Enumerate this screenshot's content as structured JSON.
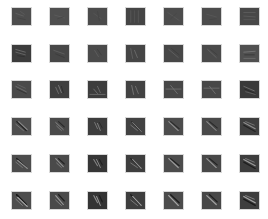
{
  "figure": {
    "rows": 6,
    "cols": 7,
    "background": "#ffffff",
    "tile_border": "#d8d8d8",
    "layout": {
      "x0": 11,
      "y0": 7,
      "dx": 38,
      "dy": 36.7,
      "w": 21,
      "h": 19
    },
    "tiles": [
      [
        {
          "bg": "#4d4d4d",
          "strokes": [
            [
              "M4 6 L12 9",
              "#5f5f5f",
              1
            ],
            [
              "M6 11 L14 13",
              "#444",
              1
            ],
            [
              "M9 4 L13 7",
              "#5a5a5a",
              1
            ]
          ]
        },
        {
          "bg": "#4f4f4f",
          "strokes": [
            [
              "M5 8 L15 11",
              "#5b5b5b",
              1
            ],
            [
              "M8 12 L14 10",
              "#474747",
              1
            ]
          ]
        },
        {
          "bg": "#4b4b4b",
          "strokes": [
            [
              "M6 6 L14 12",
              "#565656",
              1
            ],
            [
              "M10 4 L12 14",
              "#444",
              1
            ]
          ]
        },
        {
          "bg": "#454545",
          "strokes": [
            [
              "M5 3 L5 16",
              "#575757",
              1
            ],
            [
              "M9 3 L9 16",
              "#525252",
              1
            ],
            [
              "M13 3 L13 16",
              "#575757",
              1
            ]
          ]
        },
        {
          "bg": "#4c4c4c",
          "strokes": [
            [
              "M4 5 L16 14",
              "#585858",
              1
            ],
            [
              "M7 12 L13 6",
              "#464646",
              1
            ]
          ]
        },
        {
          "bg": "#4c4c4c",
          "strokes": [
            [
              "M5 7 L15 10",
              "#575757",
              1
            ],
            [
              "M8 13 L15 12",
              "#454545",
              1
            ]
          ]
        },
        {
          "bg": "#484848",
          "strokes": [
            [
              "M4 5 L16 5",
              "#5d5d5d",
              1
            ],
            [
              "M4 9 L16 10",
              "#5a5a5a",
              1
            ],
            [
              "M4 13 L16 13",
              "#565656",
              1
            ]
          ]
        }
      ],
      [
        {
          "bg": "#3c3c3c",
          "strokes": [
            [
              "M4 5 L14 8",
              "#6a6a6a",
              1
            ],
            [
              "M4 8 L14 11",
              "#666",
              1
            ],
            [
              "M6 12 L13 13",
              "#303030",
              1
            ]
          ]
        },
        {
          "bg": "#474747",
          "strokes": [
            [
              "M4 6 L15 10",
              "#5e5e5e",
              1
            ],
            [
              "M6 10 L15 14",
              "#3c3c3c",
              1
            ]
          ]
        },
        {
          "bg": "#4a4a4a",
          "strokes": [
            [
              "M7 6 L11 13",
              "#5c5c5c",
              1
            ],
            [
              "M10 5 L14 11",
              "#3f3f3f",
              1
            ]
          ]
        },
        {
          "bg": "#454545",
          "strokes": [
            [
              "M5 4 L7 15",
              "#5f5f5f",
              1
            ],
            [
              "M9 6 L12 14",
              "#6a6a6a",
              1
            ]
          ]
        },
        {
          "bg": "#474747",
          "strokes": [
            [
              "M5 5 L15 14",
              "#606060",
              1
            ],
            [
              "M8 4 L16 11",
              "#3d3d3d",
              1
            ]
          ]
        },
        {
          "bg": "#4a4a4a",
          "strokes": [
            [
              "M6 5 L15 14",
              "#646464",
              1
            ],
            [
              "M9 5 L16 11",
              "#3f3f3f",
              1
            ]
          ]
        },
        {
          "bg": "#505050",
          "strokes": [
            [
              "M4 8 L16 7",
              "#757575",
              1
            ],
            [
              "M5 11 L15 11",
              "#3a3a3a",
              1
            ],
            [
              "M4 15 L16 15",
              "#6a6a6a",
              1
            ]
          ]
        }
      ],
      [
        {
          "bg": "#4a4a4a",
          "strokes": [
            [
              "M4 6 L15 12",
              "#6f6f6f",
              1
            ],
            [
              "M5 9 L15 14",
              "#333",
              1
            ],
            [
              "M6 4 L14 8",
              "#616161",
              1
            ]
          ]
        },
        {
          "bg": "#3f3f3f",
          "strokes": [
            [
              "M6 7 L9 14",
              "#6c6c6c",
              1
            ],
            [
              "M9 5 L12 13",
              "#7a7a7a",
              1
            ],
            [
              "M12 6 L14 13",
              "#2e2e2e",
              1
            ]
          ]
        },
        {
          "bg": "#3d3d3d",
          "strokes": [
            [
              "M6 9 L10 14",
              "#707070",
              1
            ],
            [
              "M10 6 L13 13",
              "#6a6a6a",
              1
            ],
            [
              "M2 15 L18 15",
              "#6a6a6a",
              1
            ]
          ]
        },
        {
          "bg": "#424242",
          "strokes": [
            [
              "M6 5 L8 15",
              "#767676",
              1
            ],
            [
              "M10 6 L13 14",
              "#6f6f6f",
              1
            ]
          ]
        },
        {
          "bg": "#474747",
          "strokes": [
            [
              "M2 9 L18 9",
              "#6c6c6c",
              1
            ],
            [
              "M7 5 L14 14",
              "#707070",
              1
            ]
          ]
        },
        {
          "bg": "#484848",
          "strokes": [
            [
              "M2 8 L18 8",
              "#6c6c6c",
              1
            ],
            [
              "M8 6 L14 14",
              "#707070",
              1
            ]
          ]
        },
        {
          "bg": "#3a3a3a",
          "strokes": [
            [
              "M4 6 L15 11",
              "#6e6e6e",
              1
            ],
            [
              "M5 9 L16 14",
              "#272727",
              1
            ],
            [
              "M6 12 L16 15",
              "#606060",
              1
            ]
          ]
        }
      ],
      [
        {
          "bg": "#4f4f4f",
          "strokes": [
            [
              "M5 4 L15 14",
              "#222",
              1.3
            ],
            [
              "M7 4 L16 13",
              "#8a8a8a",
              1.1
            ],
            [
              "M4 7 L12 14",
              "#7a7a7a",
              1
            ]
          ]
        },
        {
          "bg": "#4a4a4a",
          "strokes": [
            [
              "M6 5 L14 13",
              "#8a8a8a",
              1
            ],
            [
              "M9 4 L15 10",
              "#2a2a2a",
              1.2
            ],
            [
              "M7 9 L12 14",
              "#7a7a7a",
              1
            ]
          ]
        },
        {
          "bg": "#3d3d3d",
          "strokes": [
            [
              "M7 5 L10 12",
              "#7a7a7a",
              1
            ],
            [
              "M10 6 L13 14",
              "#828282",
              1
            ],
            [
              "M12 5 L15 11",
              "#2a2a2a",
              1
            ]
          ]
        },
        {
          "bg": "#424242",
          "strokes": [
            [
              "M6 4 L15 14",
              "#2a2a2a",
              1.3
            ],
            [
              "M7 5 L16 15",
              "#8a8a8a",
              1
            ],
            [
              "M5 8 L12 14",
              "#7a7a7a",
              1
            ]
          ]
        },
        {
          "bg": "#4c4c4c",
          "strokes": [
            [
              "M5 4 L15 14",
              "#8e8e8e",
              1.2
            ],
            [
              "M7 4 L16 12",
              "#2c2c2c",
              1.2
            ]
          ]
        },
        {
          "bg": "#494949",
          "strokes": [
            [
              "M5 4 L15 14",
              "#8a8a8a",
              1.1
            ],
            [
              "M8 4 L16 11",
              "#2a2a2a",
              1.2
            ]
          ]
        },
        {
          "bg": "#3f3f3f",
          "strokes": [
            [
              "M4 5 L16 12",
              "#8e8e8e",
              1.2
            ],
            [
              "M4 8 L16 15",
              "#222",
              1.3
            ],
            [
              "M6 4 L15 8",
              "#777",
              1
            ]
          ]
        }
      ],
      [
        {
          "bg": "#4c4c4c",
          "strokes": [
            [
              "M5 4 L15 14",
              "#1e1e1e",
              1.5
            ],
            [
              "M6 6 L16 15",
              "#9a9a9a",
              1.2
            ],
            [
              "M4 8 L11 14",
              "#7a7a7a",
              1
            ]
          ]
        },
        {
          "bg": "#4a4a4a",
          "strokes": [
            [
              "M6 4 L14 13",
              "#929292",
              1.1
            ],
            [
              "M9 4 L15 10",
              "#222",
              1.3
            ],
            [
              "M7 9 L12 14",
              "#808080",
              1
            ]
          ]
        },
        {
          "bg": "#363636",
          "strokes": [
            [
              "M6 5 L10 12",
              "#848484",
              1.1
            ],
            [
              "M9 5 L13 14",
              "#8e8e8e",
              1
            ],
            [
              "M12 5 L15 11",
              "#222",
              1.2
            ]
          ]
        },
        {
          "bg": "#3e3e3e",
          "strokes": [
            [
              "M5 4 L15 14",
              "#222",
              1.4
            ],
            [
              "M7 5 L16 15",
              "#969696",
              1.1
            ],
            [
              "M5 9 L12 14",
              "#7a7a7a",
              1
            ]
          ]
        },
        {
          "bg": "#4c4c4c",
          "strokes": [
            [
              "M5 4 L15 14",
              "#9a9a9a",
              1.3
            ],
            [
              "M7 4 L16 12",
              "#222",
              1.3
            ]
          ]
        },
        {
          "bg": "#484848",
          "strokes": [
            [
              "M5 4 L15 14",
              "#969696",
              1.2
            ],
            [
              "M8 4 L16 11",
              "#222",
              1.3
            ]
          ]
        },
        {
          "bg": "#3d3d3d",
          "strokes": [
            [
              "M4 5 L16 12",
              "#9a9a9a",
              1.3
            ],
            [
              "M4 8 L16 15",
              "#1e1e1e",
              1.4
            ],
            [
              "M6 4 L15 8",
              "#7e7e7e",
              1
            ]
          ]
        }
      ],
      [
        {
          "bg": "#4d4d4d",
          "strokes": [
            [
              "M5 3 L15 14",
              "#151515",
              1.7
            ],
            [
              "M6 6 L16 16",
              "#a8a8a8",
              1.3
            ],
            [
              "M4 8 L11 15",
              "#828282",
              1
            ]
          ]
        },
        {
          "bg": "#4a4a4a",
          "strokes": [
            [
              "M6 4 L14 14",
              "#9a9a9a",
              1.2
            ],
            [
              "M9 3 L15 10",
              "#1e1e1e",
              1.4
            ],
            [
              "M6 9 L12 15",
              "#888",
              1
            ]
          ]
        },
        {
          "bg": "#343434",
          "strokes": [
            [
              "M6 4 L10 12",
              "#8e8e8e",
              1.1
            ],
            [
              "M9 5 L13 15",
              "#969696",
              1.1
            ],
            [
              "M12 4 L15 11",
              "#1e1e1e",
              1.3
            ]
          ]
        },
        {
          "bg": "#3e3e3e",
          "strokes": [
            [
              "M5 3 L15 14",
              "#1e1e1e",
              1.5
            ],
            [
              "M7 5 L16 15",
              "#a0a0a0",
              1.2
            ],
            [
              "M5 9 L12 15",
              "#808080",
              1
            ]
          ]
        },
        {
          "bg": "#4c4c4c",
          "strokes": [
            [
              "M5 4 L15 15",
              "#a4a4a4",
              1.4
            ],
            [
              "M7 3 L16 12",
              "#1e1e1e",
              1.4
            ]
          ]
        },
        {
          "bg": "#474747",
          "strokes": [
            [
              "M5 4 L15 14",
              "#a0a0a0",
              1.3
            ],
            [
              "M8 3 L16 11",
              "#1e1e1e",
              1.4
            ]
          ]
        },
        {
          "bg": "#3d3d3d",
          "strokes": [
            [
              "M4 5 L16 12",
              "#a4a4a4",
              1.4
            ],
            [
              "M4 8 L16 15",
              "#1a1a1a",
              1.5
            ],
            [
              "M6 4 L15 8",
              "#848484",
              1
            ]
          ]
        }
      ]
    ]
  }
}
